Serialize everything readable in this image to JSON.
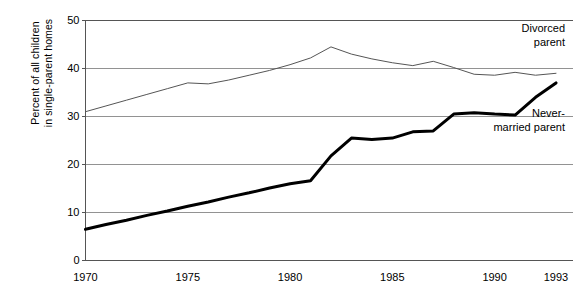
{
  "chart_data": {
    "type": "line",
    "title": "",
    "subtitle": "",
    "xlabel": "",
    "ylabel": "Percent of all children in single-parent homes",
    "ylabel_lines": [
      "Percent of all children",
      "in single-parent homes"
    ],
    "xlim": [
      1970,
      1993
    ],
    "ylim": [
      0,
      50
    ],
    "grid": true,
    "gridlines_y": [
      0,
      10,
      20,
      30,
      40,
      50
    ],
    "legend_position": "inline-right",
    "ytick_labels": [
      "0",
      "10",
      "20",
      "30",
      "40",
      "50"
    ],
    "ytick_values": [
      0,
      10,
      20,
      30,
      40,
      50
    ],
    "xtick_labels": [
      "1970",
      "1975",
      "1980",
      "1985",
      "1990",
      "1993"
    ],
    "xtick_values": [
      1970,
      1975,
      1980,
      1985,
      1990,
      1993
    ],
    "x": [
      1970,
      1971,
      1972,
      1973,
      1974,
      1975,
      1976,
      1977,
      1978,
      1979,
      1980,
      1981,
      1982,
      1983,
      1984,
      1985,
      1986,
      1987,
      1988,
      1989,
      1990,
      1991,
      1992,
      1993
    ],
    "series": [
      {
        "name": "Divorced parent",
        "label_lines": [
          "Divorced",
          "parent"
        ],
        "color": "#555555",
        "line_width": 1,
        "values": [
          31.0,
          32.2,
          33.4,
          34.6,
          35.8,
          37.0,
          36.8,
          37.6,
          38.6,
          39.6,
          40.8,
          42.2,
          44.5,
          43.0,
          42.0,
          41.2,
          40.6,
          41.5,
          40.2,
          38.8,
          38.6,
          39.2,
          38.6,
          39.0
        ]
      },
      {
        "name": "Never-married parent",
        "label_lines": [
          "Never-",
          "married parent"
        ],
        "color": "#000000",
        "line_width": 3,
        "values": [
          6.5,
          7.5,
          8.4,
          9.4,
          10.3,
          11.3,
          12.2,
          13.2,
          14.1,
          15.1,
          16.0,
          16.6,
          21.8,
          25.5,
          25.2,
          25.5,
          26.8,
          27.0,
          30.5,
          30.8,
          30.5,
          30.3,
          34.0,
          37.0
        ]
      }
    ],
    "annotations": [
      {
        "text": "Divorced parent",
        "x": 1993,
        "y": 46
      },
      {
        "text": "Never-married parent",
        "x": 1993,
        "y": 30
      }
    ]
  },
  "colors": {
    "axis": "#555555",
    "grid": "#777777",
    "background": "#ffffff",
    "text": "#000000"
  }
}
